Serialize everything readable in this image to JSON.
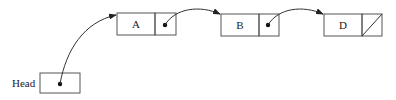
{
  "diagram": {
    "type": "linked-list",
    "head_label": "Head",
    "nodes": [
      {
        "label": "A",
        "next": "B"
      },
      {
        "label": "B",
        "next": "D"
      },
      {
        "label": "D",
        "next": null
      }
    ],
    "colors": {
      "stroke": "#555555",
      "text": "#222222",
      "background": "#ffffff"
    }
  }
}
